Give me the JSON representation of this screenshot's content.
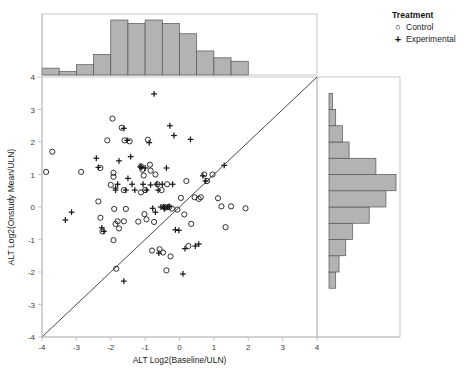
{
  "chart_data": {
    "type": "scatter",
    "title": "",
    "xlabel": "ALT Log2(Baseline/ULN)",
    "ylabel": "ALT Log2(Onstudy Mean/ULN)",
    "xlim": [
      -4,
      4
    ],
    "ylim": [
      -4,
      4
    ],
    "xticks": [
      -4,
      -3,
      -2,
      -1,
      0,
      1,
      2,
      3,
      4
    ],
    "yticks": [
      -4,
      -3,
      -2,
      -1,
      0,
      1,
      2,
      3,
      4
    ],
    "xtick_labels": [
      "-4",
      "-3",
      "-2",
      "-1",
      "0",
      "1",
      "2",
      "3",
      "4"
    ],
    "ytick_labels": [
      "-4",
      "-3",
      "-2",
      "-1",
      "0",
      "1",
      "2",
      "3",
      "4"
    ],
    "grid": false,
    "reference_line": {
      "type": "identity",
      "from": [
        -4,
        -4
      ],
      "to": [
        4,
        4
      ],
      "label": "y = x"
    },
    "legend": {
      "title": "Treatment",
      "position": "top-right-outside",
      "entries": [
        {
          "label": "Control",
          "marker": "circle",
          "symbol": "○"
        },
        {
          "label": "Experimental",
          "marker": "plus",
          "symbol": "+"
        }
      ]
    },
    "series": [
      {
        "name": "Control",
        "marker": "circle",
        "points": [
          [
            -3.7,
            1.7
          ],
          [
            -3.88,
            1.08
          ],
          [
            -2.86,
            1.08
          ],
          [
            -2.3,
            1.2
          ],
          [
            -2.36,
            0.17
          ],
          [
            -2.3,
            -0.33
          ],
          [
            -2.24,
            -0.75
          ],
          [
            -1.95,
            2.72
          ],
          [
            -2.1,
            2.05
          ],
          [
            -1.92,
            1.05
          ],
          [
            -1.92,
            0.93
          ],
          [
            -2.0,
            0.68
          ],
          [
            -1.9,
            -0.06
          ],
          [
            -1.8,
            -0.44
          ],
          [
            -1.86,
            -0.52
          ],
          [
            -1.76,
            -0.66
          ],
          [
            -1.92,
            -1.02
          ],
          [
            -1.84,
            -1.9
          ],
          [
            -1.68,
            2.44
          ],
          [
            -1.6,
            2.05
          ],
          [
            -1.62,
            0.52
          ],
          [
            -1.56,
            -0.06
          ],
          [
            -1.45,
            2.02
          ],
          [
            -1.12,
            1.25
          ],
          [
            -1.08,
            1.15
          ],
          [
            -1.04,
            0.97
          ],
          [
            -1.0,
            0.52
          ],
          [
            -1.02,
            -0.22
          ],
          [
            -0.96,
            -0.38
          ],
          [
            -1.2,
            -0.45
          ],
          [
            -1.12,
            0.45
          ],
          [
            -0.92,
            2.07
          ],
          [
            -0.86,
            1.3
          ],
          [
            -0.84,
            1.12
          ],
          [
            -0.8,
            -1.34
          ],
          [
            -0.74,
            -0.46
          ],
          [
            -0.7,
            1.0
          ],
          [
            -0.64,
            0.7
          ],
          [
            -0.58,
            -1.3
          ],
          [
            -0.52,
            0.52
          ],
          [
            -0.48,
            -1.4
          ],
          [
            -0.44,
            0.0
          ],
          [
            -0.4,
            -0.02
          ],
          [
            -0.38,
            -1.95
          ],
          [
            -0.36,
            0.7
          ],
          [
            -0.3,
            0.0
          ],
          [
            -0.26,
            -1.52
          ],
          [
            -0.22,
            -0.05
          ],
          [
            -0.06,
            -0.08
          ],
          [
            0.04,
            0.28
          ],
          [
            0.14,
            -0.23
          ],
          [
            0.2,
            0.8
          ],
          [
            0.26,
            -1.2
          ],
          [
            0.34,
            -0.52
          ],
          [
            0.44,
            0.3
          ],
          [
            0.56,
            0.25
          ],
          [
            0.62,
            0.3
          ],
          [
            0.72,
            1.0
          ],
          [
            0.8,
            0.8
          ],
          [
            0.96,
            1.0
          ],
          [
            1.12,
            0.27
          ],
          [
            1.22,
            0.02
          ],
          [
            1.34,
            -0.62
          ],
          [
            1.5,
            0.02
          ],
          [
            1.92,
            -0.04
          ],
          [
            -1.62,
            -0.44
          ]
        ]
      },
      {
        "name": "Experimental",
        "marker": "plus",
        "points": [
          [
            -3.32,
            -0.4
          ],
          [
            -3.14,
            -0.16
          ],
          [
            -2.42,
            1.5
          ],
          [
            -2.36,
            1.22
          ],
          [
            -2.26,
            -0.64
          ],
          [
            -2.2,
            -0.75
          ],
          [
            -1.86,
            0.58
          ],
          [
            -1.8,
            0.7
          ],
          [
            -1.76,
            1.42
          ],
          [
            -1.62,
            2.42
          ],
          [
            -1.56,
            0.52
          ],
          [
            -1.5,
            0.88
          ],
          [
            -1.52,
            2.05
          ],
          [
            -1.42,
            1.55
          ],
          [
            -1.38,
            0.7
          ],
          [
            -1.3,
            0.52
          ],
          [
            -1.1,
            1.22
          ],
          [
            -1.06,
            0.7
          ],
          [
            -1.0,
            1.2
          ],
          [
            -0.96,
            0.52
          ],
          [
            -0.88,
            1.98
          ],
          [
            -0.84,
            0.68
          ],
          [
            -0.78,
            -0.04
          ],
          [
            -0.74,
            3.48
          ],
          [
            -0.7,
            -0.16
          ],
          [
            -0.66,
            0.7
          ],
          [
            -0.62,
            0.52
          ],
          [
            -0.6,
            -1.42
          ],
          [
            -0.54,
            0.0
          ],
          [
            -0.5,
            0.7
          ],
          [
            -0.44,
            -0.04
          ],
          [
            -0.38,
            1.2
          ],
          [
            -0.34,
            0.0
          ],
          [
            -0.28,
            2.5
          ],
          [
            -0.2,
            0.7
          ],
          [
            -0.16,
            2.2
          ],
          [
            -0.12,
            -0.7
          ],
          [
            -0.02,
            -0.72
          ],
          [
            0.1,
            -2.06
          ],
          [
            0.16,
            -1.28
          ],
          [
            0.32,
            2.08
          ],
          [
            0.46,
            -1.2
          ],
          [
            0.56,
            -1.14
          ],
          [
            0.68,
            0.96
          ],
          [
            0.76,
            0.8
          ],
          [
            1.3,
            1.28
          ],
          [
            -1.86,
            0.52
          ],
          [
            -1.14,
            1.24
          ],
          [
            -0.46,
            0.0
          ],
          [
            -0.44,
            -0.05
          ],
          [
            -1.62,
            -2.28
          ],
          [
            -0.3,
            0.02
          ]
        ]
      }
    ],
    "top_histogram": {
      "orientation": "vertical",
      "variable": "ALT Log2(Baseline/ULN)",
      "bin_edges": [
        -4.0,
        -3.5,
        -3.0,
        -2.5,
        -2.0,
        -1.5,
        -1.0,
        -0.5,
        0.0,
        0.5,
        1.0,
        1.5,
        2.0
      ],
      "counts": [
        2,
        1,
        3,
        6,
        16,
        15,
        16,
        15,
        12,
        7,
        5,
        4
      ],
      "fill_color": "#b3b3b3",
      "edge_color": "#555555"
    },
    "right_histogram": {
      "orientation": "horizontal",
      "variable": "ALT Log2(Onstudy Mean/ULN)",
      "bin_edges": [
        -2.5,
        -2.0,
        -1.5,
        -1.0,
        -0.5,
        0.0,
        0.5,
        1.0,
        1.5,
        2.0,
        2.5,
        3.0,
        3.5
      ],
      "counts": [
        2,
        3,
        5,
        7,
        12,
        17,
        20,
        14,
        6,
        4,
        2,
        1
      ],
      "fill_color": "#b3b3b3",
      "edge_color": "#555555"
    },
    "style": {
      "background": "#ffffff",
      "frame_color": "#b9b9b9",
      "marker_color": "#1a1a1a",
      "line_color": "#333333"
    }
  }
}
